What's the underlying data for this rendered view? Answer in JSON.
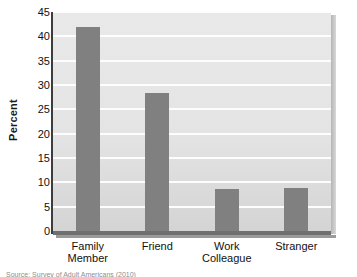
{
  "chart_data": {
    "type": "bar",
    "title": "",
    "xlabel": "",
    "ylabel": "Percent",
    "categories": [
      "Family Member",
      "Friend",
      "Work Colleague",
      "Stranger"
    ],
    "category_lines": [
      [
        "Family",
        "Member"
      ],
      [
        "Friend",
        ""
      ],
      [
        "Work",
        "Colleague"
      ],
      [
        "Stranger",
        ""
      ]
    ],
    "values": [
      42.0,
      28.4,
      8.6,
      8.9
    ],
    "ylim": [
      0,
      45
    ],
    "yticks": [
      0,
      5,
      10,
      15,
      20,
      25,
      30,
      35,
      40,
      45
    ],
    "ytick_labels": [
      "0",
      "5",
      "10",
      "15",
      "20",
      "25",
      "30",
      "35",
      "40",
      "45"
    ],
    "grid": "horizontal",
    "legend": "none",
    "bar_color": "#808080",
    "plot_background": "#e6e6e6",
    "gridline_color": "#fdfdfd",
    "axis_color": "#3d3d3d"
  },
  "axis": {
    "y_title": "Percent"
  },
  "caption": {
    "source_line": "Source: Survey of Adult Americans (2010)"
  }
}
